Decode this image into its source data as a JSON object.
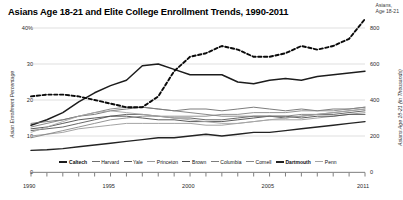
{
  "header": {
    "title": "Asians Age 18-21 and Elite College Enrollment Trends, 1990-2011",
    "corner_annotation": "Asians,\nAge 18-21"
  },
  "chart_data": {
    "type": "line",
    "title": "Asians Age 18-21 and Elite College Enrollment Trends, 1990-2011",
    "xlabel": "",
    "ylabel": "Asian Enrollment Percentage",
    "y2label": "Asians Age 18-21 (in Thousands)",
    "xlim": [
      1990,
      2011
    ],
    "ylim": [
      0,
      40
    ],
    "y2lim": [
      0,
      800
    ],
    "grid": true,
    "legend_position": "bottom",
    "x": [
      1990,
      1991,
      1992,
      1993,
      1994,
      1995,
      1996,
      1997,
      1998,
      1999,
      2000,
      2001,
      2002,
      2003,
      2004,
      2005,
      2006,
      2007,
      2008,
      2009,
      2010,
      2011
    ],
    "yticks_left": [
      "0",
      "10",
      "20",
      "30",
      "40%"
    ],
    "yticks_right": [
      "0",
      "200",
      "400",
      "600",
      "800"
    ],
    "xticks": [
      "1990",
      "1995",
      "2000",
      "2005",
      "2011"
    ],
    "series": [
      {
        "name": "Caltech",
        "axis": "left",
        "color": "#1c1c1c",
        "width": 1.5,
        "dash": "none",
        "values": [
          13.0,
          14.5,
          16.5,
          19.5,
          22.0,
          24.0,
          25.5,
          29.5,
          30.0,
          28.5,
          27.0,
          27.0,
          27.0,
          25.0,
          24.5,
          25.5,
          26.0,
          25.5,
          26.5,
          27.0,
          27.5,
          28.0
        ]
      },
      {
        "name": "Harvard",
        "axis": "left",
        "color": "#6e6e6e",
        "width": 0.9,
        "dash": "none",
        "values": [
          13.5,
          14.0,
          14.5,
          15.5,
          16.0,
          17.0,
          17.5,
          18.0,
          17.5,
          17.0,
          17.5,
          17.5,
          17.0,
          17.5,
          18.0,
          17.5,
          17.0,
          17.5,
          17.0,
          17.5,
          17.5,
          18.0
        ]
      },
      {
        "name": "Yale",
        "axis": "left",
        "color": "#585858",
        "width": 0.9,
        "dash": "none",
        "values": [
          11.5,
          12.0,
          12.5,
          13.5,
          14.5,
          15.5,
          16.0,
          16.0,
          15.5,
          15.0,
          15.0,
          14.5,
          14.5,
          15.0,
          15.5,
          15.5,
          15.0,
          15.5,
          16.0,
          16.0,
          16.5,
          17.0
        ]
      },
      {
        "name": "Princeton",
        "axis": "left",
        "color": "#9a9a9a",
        "width": 0.9,
        "dash": "none",
        "values": [
          10.0,
          10.5,
          11.0,
          12.0,
          12.5,
          13.0,
          13.5,
          13.5,
          13.5,
          13.5,
          13.5,
          13.0,
          13.0,
          13.5,
          14.0,
          14.5,
          14.5,
          14.5,
          15.0,
          15.5,
          16.0,
          16.5
        ]
      },
      {
        "name": "Brown",
        "axis": "left",
        "color": "#4a4a4a",
        "width": 0.9,
        "dash": "none",
        "values": [
          12.0,
          12.5,
          13.5,
          14.5,
          15.0,
          15.5,
          15.5,
          15.0,
          14.5,
          14.5,
          14.0,
          14.0,
          14.0,
          14.5,
          15.0,
          15.5,
          15.5,
          15.0,
          15.5,
          15.5,
          16.0,
          16.0
        ]
      },
      {
        "name": "Columbia",
        "axis": "left",
        "color": "#7d7d7d",
        "width": 0.9,
        "dash": "none",
        "values": [
          12.5,
          13.5,
          14.5,
          15.5,
          16.5,
          17.5,
          18.0,
          18.0,
          17.5,
          17.0,
          16.5,
          16.0,
          15.5,
          15.5,
          15.5,
          15.5,
          15.5,
          16.0,
          16.0,
          16.5,
          17.0,
          17.5
        ]
      },
      {
        "name": "Cornell",
        "axis": "left",
        "color": "#888888",
        "width": 0.9,
        "dash": "none",
        "values": [
          9.5,
          10.5,
          11.5,
          12.5,
          13.5,
          14.5,
          15.0,
          15.5,
          15.5,
          15.5,
          15.5,
          15.5,
          16.0,
          16.0,
          16.5,
          16.5,
          16.5,
          17.0,
          17.0,
          17.0,
          17.5,
          18.0
        ]
      },
      {
        "name": "Dartmouth",
        "axis": "left",
        "color": "#232323",
        "width": 1.4,
        "dash": "none",
        "values": [
          6.0,
          6.2,
          6.5,
          7.0,
          7.5,
          8.0,
          8.5,
          9.0,
          9.5,
          9.5,
          10.0,
          10.5,
          10.0,
          10.5,
          11.0,
          11.0,
          11.5,
          12.0,
          12.5,
          13.0,
          13.5,
          14.0
        ]
      },
      {
        "name": "Penn",
        "axis": "left",
        "color": "#a5a5a5",
        "width": 0.9,
        "dash": "none",
        "values": [
          11.0,
          12.5,
          14.0,
          15.5,
          16.5,
          17.0,
          16.5,
          16.0,
          15.5,
          15.0,
          14.5,
          14.0,
          13.5,
          13.5,
          14.0,
          14.5,
          15.0,
          15.5,
          16.0,
          16.5,
          17.0,
          17.5
        ]
      },
      {
        "name": "Asians Age 18-21",
        "axis": "right",
        "color": "#0a0a0a",
        "width": 1.9,
        "dash": "dashed",
        "values": [
          420,
          430,
          430,
          420,
          400,
          380,
          360,
          360,
          420,
          560,
          640,
          660,
          700,
          680,
          640,
          640,
          660,
          700,
          680,
          700,
          740,
          850
        ]
      }
    ]
  },
  "legend": {
    "items": [
      {
        "label": "Caltech",
        "color": "#1c1c1c",
        "bold": true,
        "width": 2.0
      },
      {
        "label": "Harvard",
        "color": "#6e6e6e",
        "bold": false,
        "width": 1.1
      },
      {
        "label": "Yale",
        "color": "#585858",
        "bold": false,
        "width": 1.1
      },
      {
        "label": "Princeton",
        "color": "#9a9a9a",
        "bold": false,
        "width": 1.1
      },
      {
        "label": "Brown",
        "color": "#4a4a4a",
        "bold": false,
        "width": 1.1
      },
      {
        "label": "Columbia",
        "color": "#7d7d7d",
        "bold": false,
        "width": 1.1
      },
      {
        "label": "Cornell",
        "color": "#888888",
        "bold": false,
        "width": 1.1
      },
      {
        "label": "Dartmouth",
        "color": "#232323",
        "bold": true,
        "width": 2.0
      },
      {
        "label": "Penn",
        "color": "#a5a5a5",
        "bold": false,
        "width": 1.1
      }
    ]
  }
}
